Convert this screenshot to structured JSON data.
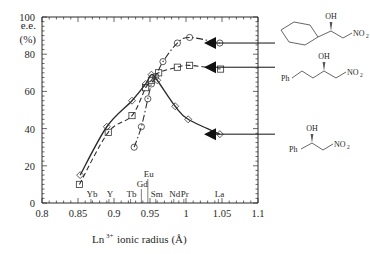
{
  "chart_data": {
    "type": "line",
    "title": "",
    "xlabel": "Ln3+ ionic radius (A)",
    "ylabel": "e.e. (%)",
    "xlim": [
      0.8,
      1.1
    ],
    "ylim": [
      0,
      100
    ],
    "grid": false,
    "legend_position": "none",
    "x_ticks": [
      0.8,
      0.85,
      0.9,
      0.95,
      1.0,
      1.05,
      1.1
    ],
    "x_tick_labels": [
      "0.8",
      "0.85",
      "0.9",
      "0.95",
      "1",
      "1.05",
      "1.1"
    ],
    "y_ticks": [
      0,
      20,
      40,
      60,
      80,
      100
    ],
    "y_tick_labels": [
      "0",
      "20",
      "40",
      "60",
      "80",
      "100"
    ],
    "element_markers": [
      {
        "label": "Yb",
        "x": 0.868
      },
      {
        "label": "Y",
        "x": 0.893
      },
      {
        "label": "Tb",
        "x": 0.923
      },
      {
        "label": "Gd",
        "x": 0.938
      },
      {
        "label": "Eu",
        "x": 0.947
      },
      {
        "label": "Sm",
        "x": 0.958
      },
      {
        "label": "Nd",
        "x": 0.983
      },
      {
        "label": "Pr",
        "x": 0.997
      },
      {
        "label": "La",
        "x": 1.045
      }
    ],
    "series": [
      {
        "name": "cyclohexyl-nitroaldol",
        "marker": "circle",
        "line_style": "dash-dot",
        "points": [
          {
            "x": 0.928,
            "y": 30
          },
          {
            "x": 0.938,
            "y": 41
          },
          {
            "x": 0.947,
            "y": 56
          },
          {
            "x": 0.952,
            "y": 64
          },
          {
            "x": 0.958,
            "y": 68
          },
          {
            "x": 0.968,
            "y": 76
          },
          {
            "x": 0.988,
            "y": 86
          },
          {
            "x": 1.005,
            "y": 89
          },
          {
            "x": 1.047,
            "y": 86
          }
        ]
      },
      {
        "name": "phenylpropyl-nitroaldol",
        "marker": "square",
        "line_style": "dashed",
        "points": [
          {
            "x": 0.852,
            "y": 10
          },
          {
            "x": 0.892,
            "y": 38
          },
          {
            "x": 0.925,
            "y": 47
          },
          {
            "x": 0.944,
            "y": 62
          },
          {
            "x": 0.952,
            "y": 66
          },
          {
            "x": 0.962,
            "y": 70
          },
          {
            "x": 0.988,
            "y": 73
          },
          {
            "x": 1.005,
            "y": 74
          },
          {
            "x": 1.048,
            "y": 72
          }
        ]
      },
      {
        "name": "phenyl-nitroaldol",
        "marker": "diamond",
        "line_style": "solid",
        "points": [
          {
            "x": 0.853,
            "y": 15
          },
          {
            "x": 0.89,
            "y": 41
          },
          {
            "x": 0.925,
            "y": 55
          },
          {
            "x": 0.944,
            "y": 64
          },
          {
            "x": 0.952,
            "y": 69
          },
          {
            "x": 0.96,
            "y": 66
          },
          {
            "x": 0.985,
            "y": 52
          },
          {
            "x": 1.003,
            "y": 45
          },
          {
            "x": 1.047,
            "y": 37
          }
        ]
      }
    ],
    "annotations": [
      {
        "name": "arrow-to-cyclohexyl-series",
        "y": 86,
        "target": "cyclohexyl-nitroaldol"
      },
      {
        "name": "arrow-to-phenylpropyl-series",
        "y": 73,
        "target": "phenylpropyl-nitroaldol"
      },
      {
        "name": "arrow-to-phenyl-series",
        "y": 37,
        "target": "phenyl-nitroaldol"
      }
    ]
  },
  "axis": {
    "y_label_main": "e.e.",
    "y_label_unit": "(%)",
    "x_title_base": "Ln",
    "x_title_sup": "3+",
    "x_title_rest": "ionic radius (Å)"
  },
  "structures": [
    {
      "name": "cyclohexyl-nitroaldol",
      "oh": "OH",
      "no2_base": "NO",
      "no2_sub": "2",
      "left_group": ""
    },
    {
      "name": "phenylpropyl-nitroaldol",
      "oh": "OH",
      "no2_base": "NO",
      "no2_sub": "2",
      "left_group": "Ph"
    },
    {
      "name": "phenyl-nitroaldol",
      "oh": "OH",
      "no2_base": "NO",
      "no2_sub": "2",
      "left_group": "Ph"
    }
  ],
  "colors": {
    "axis": "#2a2a2a",
    "series_solid": "#222222",
    "series_dashed": "#333333",
    "series_dashdot": "#333333",
    "structure": "#555555",
    "arrow": "#111111"
  }
}
